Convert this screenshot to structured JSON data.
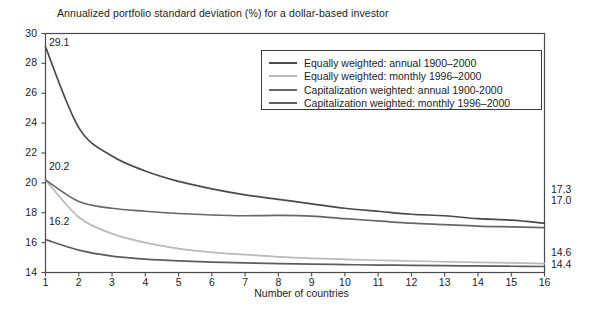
{
  "chart_data": {
    "type": "line",
    "title": "Annualized portfolio standard deviation (%) for a dollar-based investor",
    "xlabel": "Number of countries",
    "ylabel": "",
    "xlim": [
      1,
      16
    ],
    "ylim": [
      14,
      30
    ],
    "grid": false,
    "legend_position": "top-right",
    "x": [
      1,
      2,
      3,
      4,
      5,
      6,
      7,
      8,
      9,
      10,
      11,
      12,
      13,
      14,
      15,
      16
    ],
    "xticks": [
      "1",
      "2",
      "3",
      "4",
      "5",
      "6",
      "7",
      "8",
      "9",
      "10",
      "11",
      "12",
      "13",
      "14",
      "15",
      "16"
    ],
    "yticks": [
      "14",
      "16",
      "18",
      "20",
      "22",
      "24",
      "26",
      "28",
      "30"
    ],
    "series": [
      {
        "name": "Equally weighted: annual 1900–2000",
        "color": "#4a4a4a",
        "start_label": "29.1",
        "end_label": "17.3",
        "values": [
          29.1,
          23.7,
          21.8,
          20.8,
          20.1,
          19.6,
          19.2,
          18.9,
          18.6,
          18.3,
          18.1,
          17.9,
          17.8,
          17.6,
          17.5,
          17.3
        ]
      },
      {
        "name": "Equally weighted: monthly 1996–2000",
        "color": "#b9b9b9",
        "start_label": "20.2",
        "end_label": "14.6",
        "values": [
          20.2,
          17.7,
          16.6,
          16.0,
          15.6,
          15.35,
          15.2,
          15.05,
          14.95,
          14.88,
          14.82,
          14.77,
          14.72,
          14.68,
          14.64,
          14.6
        ]
      },
      {
        "name": "Capitalization weighted: annual 1900-2000",
        "color": "#676767",
        "start_label": "20.2",
        "end_label": "17.0",
        "values": [
          20.2,
          18.75,
          18.3,
          18.1,
          17.95,
          17.85,
          17.8,
          17.82,
          17.78,
          17.6,
          17.45,
          17.3,
          17.2,
          17.1,
          17.05,
          17.0
        ]
      },
      {
        "name": "Capitalization weighted: monthly 1996–2000",
        "color": "#5c5c5c",
        "start_label": "16.2",
        "end_label": "14.4",
        "values": [
          16.2,
          15.5,
          15.1,
          14.9,
          14.78,
          14.7,
          14.64,
          14.6,
          14.56,
          14.53,
          14.5,
          14.48,
          14.46,
          14.44,
          14.42,
          14.4
        ]
      }
    ],
    "start_labels": [
      {
        "text": "29.1",
        "left": 49,
        "top": 36
      },
      {
        "text": "20.2",
        "left": 49,
        "top": 160
      },
      {
        "text": "16.2",
        "left": 49,
        "top": 215
      }
    ],
    "end_labels": [
      {
        "text": "17.3",
        "top": 183
      },
      {
        "text": "17.0",
        "top": 194
      },
      {
        "text": "14.6",
        "top": 246
      },
      {
        "text": "14.4",
        "top": 258
      }
    ]
  }
}
